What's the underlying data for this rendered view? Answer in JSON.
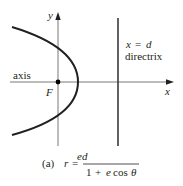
{
  "diagram": {
    "axis_labels": {
      "x": "x",
      "y": "y"
    },
    "focus_label": "F",
    "axis_text": "axis",
    "directrix": {
      "equation_lhs": "x",
      "equation_eq": "=",
      "equation_rhs": "d",
      "label": "directrix"
    },
    "caption": {
      "tag": "(a)",
      "lhs": "r",
      "eq": "=",
      "numerator": "ed",
      "denominator_one": "1",
      "denominator_plus": "+",
      "denominator_e": "e",
      "denominator_cos": "cos",
      "denominator_theta": "θ"
    },
    "colors": {
      "curve": "#231f20",
      "axes": "#5a5a5a",
      "directrix": "#3a3a3a",
      "text": "#231f20"
    }
  }
}
